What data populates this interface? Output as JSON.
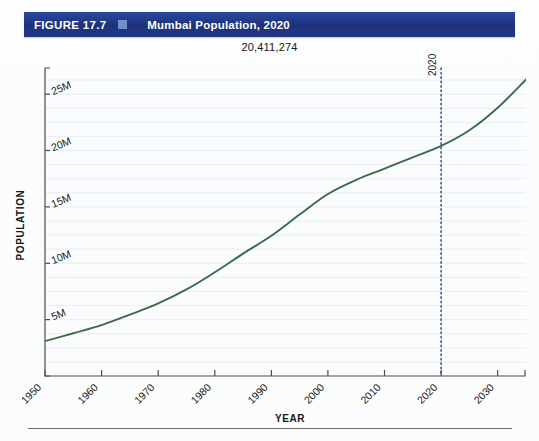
{
  "figure": {
    "label": "FIGURE 17.7",
    "marker_icon": "blue-square-icon",
    "title": "Mumbai Population, 2020",
    "bar_color": "#1d3179",
    "marker_color": "#6f8ccb"
  },
  "annotation": {
    "value_label": "20,411,274"
  },
  "chart_data": {
    "type": "line",
    "title": "Mumbai Population, 2020",
    "xlabel": "YEAR",
    "ylabel": "POPULATION",
    "xlim": [
      1950,
      2035
    ],
    "ylim": [
      0,
      27500000
    ],
    "grid": true,
    "grid_orientation": "horizontal",
    "legend": "none",
    "line_color": "#3d6b4a",
    "x_ticks": [
      "1950",
      "1960",
      "1970",
      "1980",
      "1990",
      "2000",
      "2010",
      "2020",
      "2030"
    ],
    "x_tick_values": [
      1950,
      1960,
      1970,
      1980,
      1990,
      2000,
      2010,
      2020,
      2030
    ],
    "y_ticks": [
      "5M",
      "10M",
      "15M",
      "20M",
      "25M"
    ],
    "y_tick_values": [
      5000000,
      10000000,
      15000000,
      20000000,
      25000000
    ],
    "series": [
      {
        "name": "Mumbai Population",
        "x": [
          1950,
          1955,
          1960,
          1965,
          1970,
          1975,
          1980,
          1985,
          1990,
          1995,
          2000,
          2005,
          2010,
          2015,
          2020,
          2025,
          2030,
          2035
        ],
        "values": [
          3088811,
          3790000,
          4516000,
          5440000,
          6440000,
          7680000,
          9200000,
          10860000,
          12440000,
          14320000,
          16150000,
          17400000,
          18400000,
          19400000,
          20411274,
          21800000,
          23800000,
          26300000
        ]
      }
    ],
    "annotations": [
      {
        "type": "vertical-line",
        "label": "2020",
        "x": 2020,
        "style": "dotted",
        "color": "#343c78"
      },
      {
        "type": "value-label",
        "label": "20,411,274",
        "x": 2020,
        "y": 20411274
      }
    ]
  },
  "axes": {
    "y_title": "POPULATION",
    "x_title": "YEAR"
  }
}
